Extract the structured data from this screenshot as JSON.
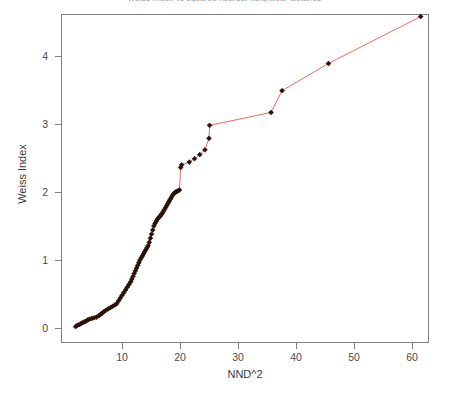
{
  "chart_data": {
    "type": "line",
    "title": "Weiss Index vs squared nearest-neighbour distance",
    "xlabel": "NND^2",
    "ylabel": "Weiss Index",
    "xlim": [
      1.0,
      63.5
    ],
    "ylim": [
      -0.12,
      4.72
    ],
    "grid": false,
    "legend": null,
    "xticks": [
      10,
      20,
      30,
      40,
      50,
      60
    ],
    "yticks": [
      0,
      1,
      2,
      3,
      4
    ],
    "marker": "filled-diamond",
    "marker_color": "#2b1008",
    "line_color": "#e8705a",
    "series": [
      {
        "name": "Weiss Index",
        "x": [
          2.0,
          2.3,
          2.6,
          2.9,
          3.2,
          3.5,
          3.8,
          4.1,
          4.4,
          4.8,
          5.2,
          5.6,
          6.0,
          6.3,
          6.6,
          6.9,
          7.2,
          7.6,
          8.0,
          8.4,
          8.8,
          9.1,
          9.4,
          9.7,
          10.0,
          10.3,
          10.6,
          10.9,
          11.2,
          11.5,
          11.7,
          11.9,
          12.1,
          12.3,
          12.5,
          12.7,
          12.9,
          13.1,
          13.3,
          13.5,
          13.7,
          13.9,
          14.1,
          14.3,
          14.5,
          14.7,
          14.9,
          15.1,
          15.3,
          15.5,
          15.7,
          15.9,
          16.1,
          16.3,
          16.5,
          16.7,
          16.9,
          17.1,
          17.3,
          17.5,
          17.7,
          17.9,
          18.1,
          18.3,
          18.5,
          18.7,
          18.9,
          19.1,
          19.3,
          19.5,
          19.7,
          19.9,
          20.1,
          20.3,
          21.6,
          22.5,
          23.4,
          24.3,
          25.0,
          25.1,
          35.7,
          37.6,
          45.6,
          61.5
        ],
        "y": [
          0.02,
          0.04,
          0.05,
          0.06,
          0.08,
          0.09,
          0.1,
          0.12,
          0.13,
          0.14,
          0.15,
          0.16,
          0.18,
          0.2,
          0.22,
          0.24,
          0.26,
          0.28,
          0.3,
          0.32,
          0.34,
          0.36,
          0.4,
          0.44,
          0.48,
          0.52,
          0.56,
          0.6,
          0.64,
          0.68,
          0.72,
          0.76,
          0.8,
          0.84,
          0.88,
          0.92,
          0.96,
          1.0,
          1.03,
          1.06,
          1.09,
          1.12,
          1.15,
          1.18,
          1.21,
          1.26,
          1.32,
          1.38,
          1.44,
          1.5,
          1.54,
          1.57,
          1.6,
          1.62,
          1.64,
          1.66,
          1.68,
          1.71,
          1.74,
          1.77,
          1.8,
          1.83,
          1.86,
          1.89,
          1.92,
          1.95,
          1.97,
          1.99,
          2.0,
          2.01,
          2.02,
          2.03,
          2.36,
          2.4,
          2.44,
          2.49,
          2.55,
          2.62,
          2.79,
          2.98,
          3.17,
          3.49,
          3.89,
          4.58
        ]
      }
    ]
  }
}
